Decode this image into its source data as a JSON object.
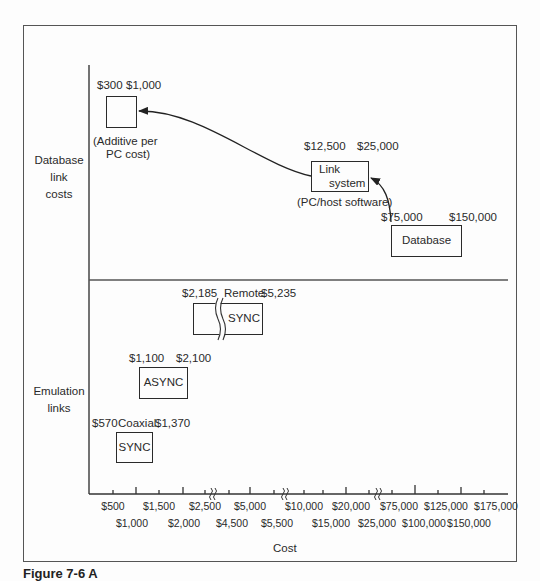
{
  "diagram": {
    "x_axis_label": "Cost",
    "sections": {
      "database": {
        "label_lines": [
          "Database",
          "link",
          "costs"
        ]
      },
      "emulation": {
        "label_lines": [
          "Emulation",
          "links"
        ]
      }
    },
    "database_boxes": [
      {
        "id": "pc-addon",
        "low": "$300",
        "high": "$1,000",
        "text": "",
        "note_lines": [
          "(Additive per",
          "PC cost)"
        ]
      },
      {
        "id": "link-system",
        "low": "$12,500",
        "high": "$25,000",
        "text_lines": [
          "Link",
          "system"
        ],
        "note": "(PC/host software)"
      },
      {
        "id": "database",
        "low": "$75,000",
        "high": "$150,000",
        "text": "Database"
      }
    ],
    "emulation_boxes": [
      {
        "id": "remote-sync",
        "low": "$2,185",
        "tag": "Remote",
        "high": "$5,235",
        "text": "SYNC"
      },
      {
        "id": "async",
        "low": "$1,100",
        "high": "$2,100",
        "text": "ASYNC"
      },
      {
        "id": "coaxial-sync",
        "low": "$570",
        "tag": "Coaxial",
        "high": "$1,370",
        "text": "SYNC"
      }
    ],
    "x_ticks_row1": [
      "$500",
      "$1,500",
      "$2,500",
      "$5,000",
      "$10,000",
      "$20,000",
      "$75,000",
      "$125,000",
      "$175,000"
    ],
    "x_ticks_row2": [
      "$1,000",
      "$2,000",
      "$4,500",
      "$5,500",
      "$15,000",
      "$25,000",
      "$100,000",
      "$150,000"
    ],
    "caption": "Figure 7-6   A"
  }
}
